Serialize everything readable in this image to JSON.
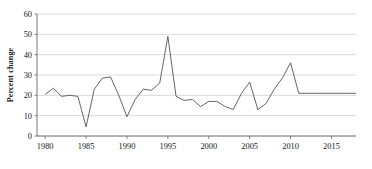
{
  "chart_data": {
    "type": "line",
    "title": "",
    "subtitle": "",
    "xlabel": "",
    "ylabel": "Percent change",
    "xlim": [
      1979,
      2018
    ],
    "ylim": [
      0,
      60
    ],
    "grid": true,
    "legend": false,
    "y_ticks": [
      0,
      10,
      20,
      30,
      40,
      50,
      60
    ],
    "y_tick_labels": [
      "0",
      "10",
      "20",
      "30",
      "40",
      "50",
      "60"
    ],
    "x_ticks": [
      1980,
      1985,
      1990,
      1995,
      2000,
      2005,
      2010,
      2015
    ],
    "x_tick_labels": [
      "1980",
      "1985",
      "1990",
      "1995",
      "2000",
      "2005",
      "2010",
      "2015"
    ],
    "series": [
      {
        "name": "Percent change",
        "color": "#555555",
        "x": [
          1980,
          1981,
          1982,
          1983,
          1984,
          1985,
          1986,
          1987,
          1988,
          1989,
          1990,
          1991,
          1992,
          1993,
          1994,
          1995,
          1996,
          1997,
          1998,
          1999,
          2000,
          2001,
          2002,
          2003,
          2004,
          2005,
          2006,
          2007,
          2008,
          2009,
          2010,
          2011,
          2012,
          2013,
          2014,
          2015,
          2016,
          2017,
          2018
        ],
        "values": [
          20.5,
          23.5,
          19.5,
          20.0,
          19.5,
          4.5,
          23.0,
          28.5,
          29.0,
          20.0,
          9.5,
          18.0,
          23.0,
          22.5,
          26.0,
          49.0,
          19.5,
          17.5,
          18.0,
          14.5,
          17.0,
          17.0,
          14.5,
          13.0,
          21.0,
          26.5,
          13.0,
          16.0,
          23.0,
          28.5,
          36.0,
          21.0,
          21.0,
          21.0,
          21.0,
          21.0,
          21.0,
          21.0,
          21.0
        ]
      }
    ],
    "colors": {
      "line": "#555555",
      "grid": "#c8c8c8",
      "axis": "#555555",
      "text": "#1a1a1a",
      "background": "#ffffff"
    }
  }
}
